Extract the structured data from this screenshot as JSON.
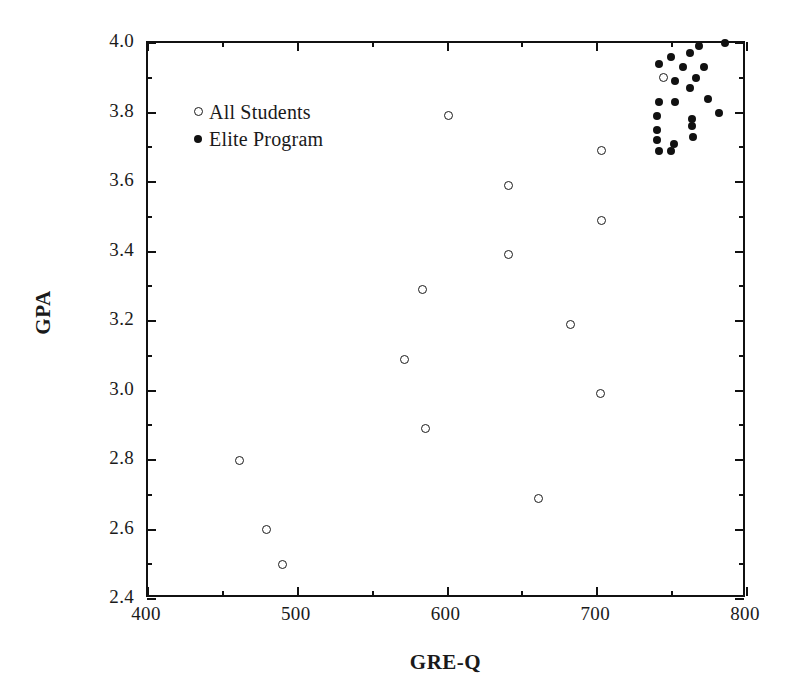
{
  "chart_data": {
    "type": "scatter",
    "title": "",
    "xlabel": "GRE-Q",
    "ylabel": "GPA",
    "xlim": [
      400,
      800
    ],
    "ylim": [
      2.4,
      4.0
    ],
    "x_major_ticks": [
      400,
      500,
      600,
      700,
      800
    ],
    "x_minor_ticks": [
      450,
      550,
      650,
      750
    ],
    "y_major_ticks": [
      2.4,
      2.6,
      2.8,
      3.0,
      3.2,
      3.4,
      3.6,
      3.8,
      4.0
    ],
    "y_minor_ticks": [
      2.5,
      2.7,
      2.9,
      3.1,
      3.3,
      3.5,
      3.7,
      3.9
    ],
    "x_tick_labels": [
      "400",
      "500",
      "600",
      "700",
      "800"
    ],
    "y_tick_labels": [
      "2.4",
      "2.6",
      "2.8",
      "3.0",
      "3.2",
      "3.4",
      "3.6",
      "3.8",
      "4.0"
    ],
    "grid": false,
    "legend_position": "upper-left-inside",
    "marker_color": "#111111",
    "frame_color": "#111111",
    "background": "#ffffff",
    "series": [
      {
        "name": "All Students",
        "marker": "open-circle",
        "color": "#1b1b1b",
        "points": [
          [
            461,
            2.8
          ],
          [
            479,
            2.6
          ],
          [
            490,
            2.5
          ],
          [
            571,
            3.09
          ],
          [
            583,
            3.29
          ],
          [
            585,
            2.89
          ],
          [
            601,
            3.79
          ],
          [
            641,
            3.59
          ],
          [
            641,
            3.39
          ],
          [
            661,
            2.69
          ],
          [
            682,
            3.19
          ],
          [
            702,
            2.99
          ],
          [
            703,
            3.69
          ],
          [
            703,
            3.49
          ],
          [
            744,
            3.9
          ]
        ]
      },
      {
        "name": "Elite Program",
        "marker": "filled-circle",
        "color": "#111111",
        "points": [
          [
            785,
            4.0
          ],
          [
            768,
            3.99
          ],
          [
            762,
            3.97
          ],
          [
            749,
            3.96
          ],
          [
            741,
            3.94
          ],
          [
            771,
            3.93
          ],
          [
            757,
            3.93
          ],
          [
            766,
            3.9
          ],
          [
            752,
            3.89
          ],
          [
            762,
            3.87
          ],
          [
            774,
            3.84
          ],
          [
            741,
            3.83
          ],
          [
            752,
            3.83
          ],
          [
            781,
            3.8
          ],
          [
            740,
            3.79
          ],
          [
            763,
            3.78
          ],
          [
            763,
            3.76
          ],
          [
            740,
            3.75
          ],
          [
            764,
            3.73
          ],
          [
            740,
            3.72
          ],
          [
            751,
            3.71
          ],
          [
            741,
            3.69
          ],
          [
            749,
            3.69
          ]
        ]
      }
    ]
  },
  "legend": {
    "items": [
      {
        "label": "All Students",
        "marker": "open-circle"
      },
      {
        "label": "Elite Program",
        "marker": "filled-circle"
      }
    ]
  },
  "axes": {
    "x_title": "GRE-Q",
    "y_title": "GPA"
  }
}
